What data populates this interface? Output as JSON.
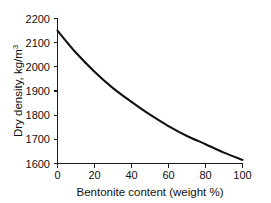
{
  "chart_data": {
    "type": "line",
    "title": "",
    "xlabel": "Bentonite content (weight %)",
    "ylabel": "Dry density, kg/m",
    "ylabel_superscript": "3",
    "ylabel_full": "Dry density, kg/m3",
    "x": [
      0,
      10,
      20,
      30,
      40,
      50,
      60,
      70,
      80,
      90,
      100
    ],
    "values": [
      2150,
      2058,
      1980,
      1912,
      1855,
      1802,
      1755,
      1714,
      1680,
      1645,
      1615
    ],
    "series": [
      {
        "name": "Dry density vs bentonite content",
        "values": [
          2150,
          2058,
          1980,
          1912,
          1855,
          1802,
          1755,
          1714,
          1680,
          1645,
          1615
        ]
      }
    ],
    "xlim": [
      0,
      100
    ],
    "ylim": [
      1600,
      2200
    ],
    "xticks": [
      0,
      20,
      40,
      60,
      80,
      100
    ],
    "yticks": [
      1600,
      1700,
      1800,
      1900,
      2000,
      2100,
      2200
    ],
    "xtick_labels": [
      "0",
      "20",
      "40",
      "60",
      "80",
      "100"
    ],
    "ytick_labels": [
      "1600",
      "1700",
      "1800",
      "1900",
      "2000",
      "2100",
      "2200"
    ],
    "grid": false,
    "legend": false,
    "legend_position": "none",
    "curve_color": "#111111",
    "axis_color": "#1a1a1a",
    "background_color": "#ffffff"
  },
  "axis_titles": {
    "x": "Bentonite content (weight %)",
    "y_main": "Dry density, kg/m",
    "y_sup": "3"
  },
  "ticks": {
    "x": [
      "0",
      "20",
      "40",
      "60",
      "80",
      "100"
    ],
    "y": [
      "2200",
      "2100",
      "2000",
      "1900",
      "1800",
      "1700",
      "1600"
    ]
  }
}
